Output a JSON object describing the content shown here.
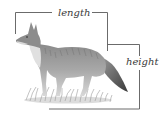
{
  "figure": {
    "labels": {
      "length": "length",
      "height": "height"
    },
    "colors": {
      "bracket": "#5a5a5a",
      "text": "#3a3a3a",
      "fur_light": "#c8c8c8",
      "fur_dark": "#4a4a4a",
      "background": "#ffffff"
    }
  }
}
